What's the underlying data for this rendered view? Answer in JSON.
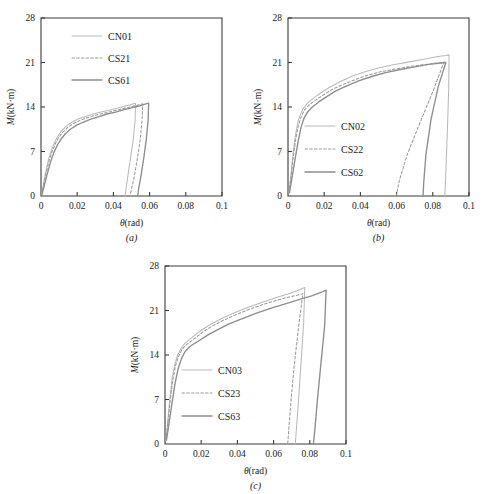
{
  "figure": {
    "panels": [
      "(a)",
      "(b)",
      "(c)"
    ],
    "axis": {
      "xlabel": "θ(rad)",
      "ylabel": "M(kN·m)",
      "xticks": [
        "0",
        "0.02",
        "0.04",
        "0.06",
        "0.08",
        "0.1"
      ],
      "xtick_values": [
        0,
        0.02,
        0.04,
        0.06,
        0.08,
        0.1
      ],
      "yticks": [
        "0",
        "7",
        "14",
        "21",
        "28"
      ],
      "ytick_values": [
        0,
        7,
        14,
        21,
        28
      ],
      "xlim": [
        0,
        0.1
      ],
      "ylim": [
        0,
        28
      ]
    },
    "colors": {
      "thin": "#b9b9b9",
      "dashed": "#9a9a9a",
      "thick": "#8d8d8d",
      "frame": "#3a3a3a",
      "text": "#1a1a1a",
      "background": "#ffffff"
    }
  },
  "chart_data": [
    {
      "type": "line",
      "panel": "(a)",
      "title": "",
      "xlabel": "θ(rad)",
      "ylabel": "M(kN·m)",
      "xlim": [
        0,
        0.1
      ],
      "ylim": [
        0,
        28
      ],
      "xticks": [
        0,
        0.02,
        0.04,
        0.06,
        0.08,
        0.1
      ],
      "yticks": [
        0,
        7,
        14,
        21,
        28
      ],
      "grid": false,
      "legend_position": "upper-left",
      "series": [
        {
          "name": "CN01",
          "style": "thin-solid",
          "x": [
            0.0005,
            0.0012,
            0.0025,
            0.0042,
            0.006,
            0.0078,
            0.0095,
            0.0115,
            0.014,
            0.017,
            0.0205,
            0.0245,
            0.029,
            0.033,
            0.0375,
            0.042,
            0.046,
            0.049,
            0.051,
            0.0522,
            0.052,
            0.051,
            0.0495,
            0.048,
            0.047,
            0.0464
          ],
          "y": [
            0.3,
            1.6,
            3.6,
            5.8,
            7.4,
            8.6,
            9.5,
            10.3,
            11.0,
            11.6,
            12.1,
            12.5,
            12.9,
            13.2,
            13.5,
            13.8,
            14.1,
            14.3,
            14.5,
            14.6,
            12.0,
            9.0,
            6.0,
            3.2,
            1.2,
            0.0
          ]
        },
        {
          "name": "CS21",
          "style": "dashed",
          "x": [
            0.0005,
            0.0013,
            0.0027,
            0.0045,
            0.0064,
            0.0082,
            0.01,
            0.0122,
            0.0148,
            0.0178,
            0.0215,
            0.0255,
            0.03,
            0.0342,
            0.0388,
            0.0432,
            0.0478,
            0.052,
            0.055,
            0.0562,
            0.0558,
            0.0548,
            0.0532,
            0.0515,
            0.05,
            0.0492
          ],
          "y": [
            0.3,
            1.5,
            3.4,
            5.6,
            7.2,
            8.4,
            9.3,
            10.1,
            10.8,
            11.4,
            11.9,
            12.3,
            12.7,
            13.0,
            13.3,
            13.6,
            13.9,
            14.2,
            14.4,
            14.5,
            11.8,
            8.8,
            5.8,
            3.0,
            1.1,
            0.0
          ]
        },
        {
          "name": "CS61",
          "style": "thick-solid",
          "x": [
            0.0006,
            0.0016,
            0.0032,
            0.0052,
            0.0072,
            0.0092,
            0.0112,
            0.0135,
            0.0162,
            0.0195,
            0.0232,
            0.0275,
            0.032,
            0.0365,
            0.0412,
            0.0458,
            0.0505,
            0.0548,
            0.058,
            0.0595,
            0.0592,
            0.0582,
            0.0568,
            0.0552,
            0.054,
            0.0534
          ],
          "y": [
            0.3,
            1.4,
            3.2,
            5.3,
            6.9,
            8.1,
            9.0,
            9.8,
            10.5,
            11.1,
            11.6,
            12.1,
            12.5,
            12.9,
            13.2,
            13.6,
            13.9,
            14.2,
            14.5,
            14.6,
            12.0,
            9.0,
            6.0,
            3.1,
            1.2,
            0.0
          ]
        }
      ],
      "legend": [
        "CN01",
        "CS21",
        "CS61"
      ]
    },
    {
      "type": "line",
      "panel": "(b)",
      "title": "",
      "xlabel": "θ(rad)",
      "ylabel": "M(kN·m)",
      "xlim": [
        0,
        0.1
      ],
      "ylim": [
        0,
        28
      ],
      "xticks": [
        0,
        0.02,
        0.04,
        0.06,
        0.08,
        0.1
      ],
      "yticks": [
        0,
        7,
        14,
        21,
        28
      ],
      "grid": false,
      "legend_position": "lower-left",
      "series": [
        {
          "name": "CN02",
          "style": "thin-solid",
          "x": [
            0.0006,
            0.0014,
            0.0026,
            0.004,
            0.0054,
            0.0068,
            0.0085,
            0.0108,
            0.014,
            0.018,
            0.023,
            0.029,
            0.036,
            0.043,
            0.051,
            0.059,
            0.067,
            0.075,
            0.082,
            0.087,
            0.089,
            0.0888,
            0.0882,
            0.0875,
            0.087,
            0.0866
          ],
          "y": [
            0.5,
            2.8,
            6.2,
            9.4,
            11.6,
            12.8,
            13.8,
            14.6,
            15.4,
            16.2,
            17.1,
            18.0,
            18.9,
            19.6,
            20.2,
            20.7,
            21.1,
            21.5,
            21.9,
            22.1,
            22.2,
            17.0,
            11.5,
            6.0,
            2.0,
            0.0
          ]
        },
        {
          "name": "CS22",
          "style": "dashed",
          "x": [
            0.0006,
            0.0015,
            0.0028,
            0.0043,
            0.0058,
            0.0073,
            0.009,
            0.0115,
            0.0148,
            0.019,
            0.024,
            0.03,
            0.037,
            0.044,
            0.052,
            0.06,
            0.068,
            0.076,
            0.082,
            0.0858,
            0.0862,
            0.08,
            0.073,
            0.066,
            0.0615,
            0.0598
          ],
          "y": [
            0.5,
            2.6,
            5.9,
            9.0,
            11.2,
            12.5,
            13.5,
            14.3,
            15.0,
            15.8,
            16.7,
            17.5,
            18.3,
            19.0,
            19.6,
            20.0,
            20.4,
            20.7,
            20.9,
            21.0,
            21.1,
            16.4,
            11.6,
            6.6,
            2.4,
            0.0
          ]
        },
        {
          "name": "CS62",
          "style": "thick-solid",
          "x": [
            0.0008,
            0.002,
            0.0038,
            0.0056,
            0.0072,
            0.0088,
            0.0108,
            0.0135,
            0.017,
            0.0212,
            0.0262,
            0.0322,
            0.039,
            0.0462,
            0.054,
            0.062,
            0.07,
            0.0778,
            0.084,
            0.0872,
            0.0872,
            0.083,
            0.079,
            0.0762,
            0.075,
            0.0746
          ],
          "y": [
            0.5,
            2.5,
            5.6,
            8.6,
            10.8,
            12.2,
            13.2,
            14.0,
            14.8,
            15.6,
            16.5,
            17.3,
            18.1,
            18.8,
            19.4,
            19.9,
            20.3,
            20.7,
            20.9,
            21.0,
            21.0,
            17.2,
            12.0,
            6.5,
            2.2,
            0.0
          ]
        }
      ],
      "legend": [
        "CN02",
        "CS22",
        "CS62"
      ]
    },
    {
      "type": "line",
      "panel": "(c)",
      "title": "",
      "xlabel": "θ(rad)",
      "ylabel": "M(kN·m)",
      "xlim": [
        0,
        0.1
      ],
      "ylim": [
        0,
        28
      ],
      "xticks": [
        0,
        0.02,
        0.04,
        0.06,
        0.08,
        0.1
      ],
      "yticks": [
        0,
        7,
        14,
        21,
        28
      ],
      "grid": false,
      "legend_position": "lower-left",
      "series": [
        {
          "name": "CN03",
          "style": "thin-solid",
          "x": [
            0.0006,
            0.0014,
            0.0026,
            0.004,
            0.0055,
            0.007,
            0.0088,
            0.0108,
            0.013,
            0.016,
            0.02,
            0.025,
            0.031,
            0.038,
            0.045,
            0.053,
            0.061,
            0.068,
            0.073,
            0.0762,
            0.0772,
            0.0766,
            0.0752,
            0.0738,
            0.0726,
            0.072
          ],
          "y": [
            0.6,
            3.2,
            7.0,
            10.4,
            12.6,
            14.0,
            15.0,
            15.8,
            16.3,
            17.0,
            17.9,
            18.8,
            19.7,
            20.6,
            21.4,
            22.2,
            23.0,
            23.6,
            24.1,
            24.5,
            24.6,
            19.0,
            13.0,
            7.0,
            2.4,
            0.0
          ]
        },
        {
          "name": "CS23",
          "style": "dashed",
          "x": [
            0.0006,
            0.0015,
            0.0028,
            0.0043,
            0.0058,
            0.0074,
            0.0092,
            0.0113,
            0.0136,
            0.0168,
            0.0208,
            0.0258,
            0.0318,
            0.0388,
            0.0458,
            0.0538,
            0.0615,
            0.0682,
            0.073,
            0.0758,
            0.0762,
            0.0738,
            0.0715,
            0.0696,
            0.0684,
            0.0678
          ],
          "y": [
            0.6,
            3.0,
            6.7,
            10.0,
            12.3,
            13.7,
            14.8,
            15.5,
            16.0,
            16.7,
            17.6,
            18.5,
            19.4,
            20.3,
            21.1,
            21.9,
            22.6,
            23.1,
            23.4,
            23.6,
            23.7,
            18.4,
            12.6,
            6.8,
            2.3,
            0.0
          ]
        },
        {
          "name": "CS63",
          "style": "thick-solid",
          "x": [
            0.0008,
            0.002,
            0.0038,
            0.0056,
            0.0074,
            0.0092,
            0.0112,
            0.0136,
            0.0162,
            0.0196,
            0.024,
            0.0292,
            0.0354,
            0.0424,
            0.0498,
            0.0578,
            0.066,
            0.074,
            0.081,
            0.0865,
            0.089,
            0.0882,
            0.0862,
            0.0842,
            0.0828,
            0.082
          ],
          "y": [
            0.6,
            2.8,
            6.3,
            9.6,
            12.0,
            13.5,
            14.6,
            15.3,
            15.8,
            16.4,
            17.2,
            18.0,
            18.9,
            19.7,
            20.5,
            21.3,
            22.0,
            22.7,
            23.3,
            23.9,
            24.2,
            18.6,
            12.8,
            6.9,
            2.3,
            0.0
          ]
        }
      ],
      "legend": [
        "CN03",
        "CS23",
        "CS63"
      ]
    }
  ]
}
